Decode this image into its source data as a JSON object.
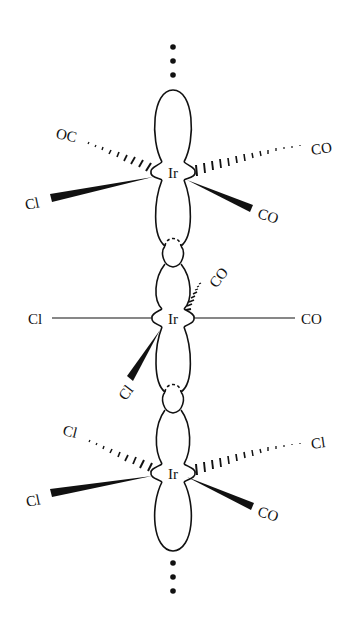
{
  "diagram": {
    "chain_continuation": "⋮",
    "units": [
      {
        "metal": "Ir",
        "ligands": {
          "back_left": "OC",
          "back_right": "CO",
          "front_left": "Cl",
          "front_right": "CO"
        }
      },
      {
        "metal": "Ir",
        "ligands": {
          "left": "Cl",
          "right": "CO",
          "back_up": "CO",
          "front_down": "Cl"
        }
      },
      {
        "metal": "Ir",
        "ligands": {
          "back_left": "Cl",
          "back_right": "Cl",
          "front_left": "Cl",
          "front_right": "CO"
        }
      }
    ],
    "colors": {
      "ink": "#111111",
      "background": "#ffffff"
    }
  }
}
